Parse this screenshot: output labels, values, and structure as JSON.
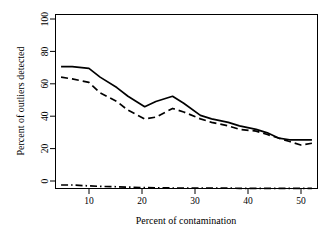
{
  "chart_data": {
    "type": "line",
    "title": "",
    "xlabel": "Percent of contamination",
    "ylabel": "Percent of outliers detected",
    "xlim": [
      4,
      51
    ],
    "ylim": [
      0,
      100
    ],
    "grid": false,
    "legend": "none",
    "xticks": [
      10,
      20,
      30,
      40,
      50
    ],
    "yticks": [
      0,
      20,
      40,
      60,
      80,
      100
    ],
    "x": [
      5,
      7,
      10,
      12,
      15,
      17,
      20,
      22,
      25,
      27,
      30,
      32,
      35,
      37,
      40,
      42,
      44,
      46,
      48,
      50
    ],
    "series": [
      {
        "name": "solid-line",
        "style": "solid",
        "values": [
          70,
          70,
          69,
          64,
          58,
          53,
          47,
          50,
          53,
          49,
          42,
          40,
          38,
          36,
          34,
          32,
          29,
          28,
          28,
          28
        ]
      },
      {
        "name": "dashed-line",
        "style": "dashed",
        "values": [
          64,
          63,
          61,
          55,
          50,
          45,
          40,
          41,
          46,
          44,
          40,
          38,
          36,
          34,
          33,
          31,
          29,
          27,
          25,
          26
        ]
      },
      {
        "name": "dash-dot-line",
        "style": "dashdot",
        "values": [
          2,
          2,
          1.5,
          1.2,
          1,
          0.8,
          0.5,
          0.4,
          0.3,
          0.3,
          0.2,
          0.2,
          0.2,
          0.1,
          0.1,
          0.1,
          0.1,
          0.1,
          0.1,
          0.1
        ]
      }
    ]
  },
  "axes": {
    "x_tick_labels": [
      "10",
      "20",
      "30",
      "40",
      "50"
    ],
    "y_tick_labels": [
      "0",
      "20",
      "40",
      "60",
      "80",
      "100"
    ],
    "x_axis_title": "Percent of contamination",
    "y_axis_title": "Percent of outliers detected"
  },
  "colors": {
    "line": "#000000",
    "axis": "#000000",
    "background": "#ffffff"
  }
}
